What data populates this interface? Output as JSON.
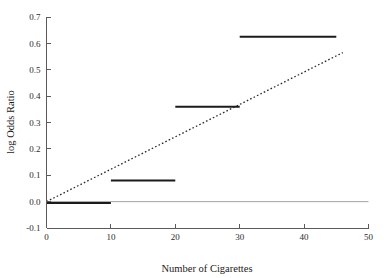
{
  "chart_data": {
    "type": "line",
    "title": "",
    "xlabel": "Number of Cigarettes",
    "ylabel": "log Odds Ratio",
    "xlim": [
      0,
      50
    ],
    "ylim": [
      -0.1,
      0.7
    ],
    "grid": false,
    "legend": null,
    "xticks": [
      0,
      10,
      20,
      30,
      40,
      50
    ],
    "xtick_labels": [
      "0",
      "10",
      "20",
      "30",
      "40",
      "50"
    ],
    "yticks": [
      -0.1,
      0.0,
      0.1,
      0.2,
      0.3,
      0.4,
      0.5,
      0.6,
      0.7
    ],
    "ytick_labels": [
      "-0.1",
      "0.0",
      "0.1",
      "0.2",
      "0.3",
      "0.4",
      "0.5",
      "0.6",
      "0.7"
    ],
    "series": [
      {
        "name": "Category step estimates",
        "style": "step-segments",
        "color": "#1b1b1b",
        "segments": [
          {
            "x_start": 0,
            "x_end": 10,
            "y": -0.005
          },
          {
            "x_start": 10,
            "x_end": 20,
            "y": 0.08
          },
          {
            "x_start": 20,
            "x_end": 30,
            "y": 0.36
          },
          {
            "x_start": 30,
            "x_end": 45,
            "y": 0.625
          }
        ]
      },
      {
        "name": "Linear trend (dotted)",
        "style": "dotted-line",
        "color": "#2a2a2a",
        "x": [
          0,
          46
        ],
        "values": [
          0.0,
          0.565
        ],
        "slope": 0.01228,
        "intercept": 0.0
      },
      {
        "name": "Zero reference line",
        "style": "solid-thin",
        "color": "#9a9a9a",
        "x": [
          0,
          50
        ],
        "values": [
          0.0,
          0.0
        ]
      }
    ]
  },
  "axes": {
    "x_title": "Number of Cigarettes",
    "y_title": "log Odds Ratio"
  }
}
